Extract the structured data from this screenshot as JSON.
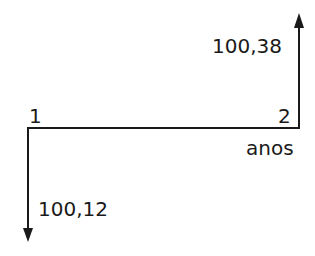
{
  "diagram": {
    "type": "cash-flow",
    "time_axis_label": "anos",
    "periods": [
      {
        "label": "1",
        "flow": {
          "value": "100,12",
          "direction": "down"
        }
      },
      {
        "label": "2",
        "flow": {
          "value": "100,38",
          "direction": "up"
        }
      }
    ],
    "colors": {
      "line": "#1a1a1a",
      "background": "#ffffff"
    }
  }
}
